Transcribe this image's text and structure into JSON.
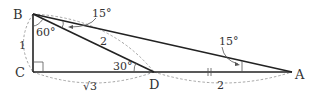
{
  "diagram": {
    "type": "geometry-triangle",
    "points": {
      "B": {
        "label": "B",
        "x": 33,
        "y": 14
      },
      "C": {
        "label": "C",
        "x": 33,
        "y": 72
      },
      "D": {
        "label": "D",
        "x": 154,
        "y": 72
      },
      "A": {
        "label": "A",
        "x": 292,
        "y": 72
      }
    },
    "segments": [
      {
        "from": "B",
        "to": "C"
      },
      {
        "from": "C",
        "to": "A"
      },
      {
        "from": "B",
        "to": "A"
      },
      {
        "from": "B",
        "to": "D"
      }
    ],
    "angles": {
      "CBD": "60°",
      "DBA": "15°",
      "BDC": "30°",
      "BAD": "15°"
    },
    "lengths": {
      "BC": "1",
      "CD": "√3",
      "BD": "2",
      "DA": "2"
    },
    "markers": {
      "right_angle_at": "C",
      "equal_tick_on": [
        "DA"
      ]
    },
    "colors": {
      "edge": "#222222",
      "dashed_arc": "#9a9a9a",
      "text": "#333333"
    }
  }
}
